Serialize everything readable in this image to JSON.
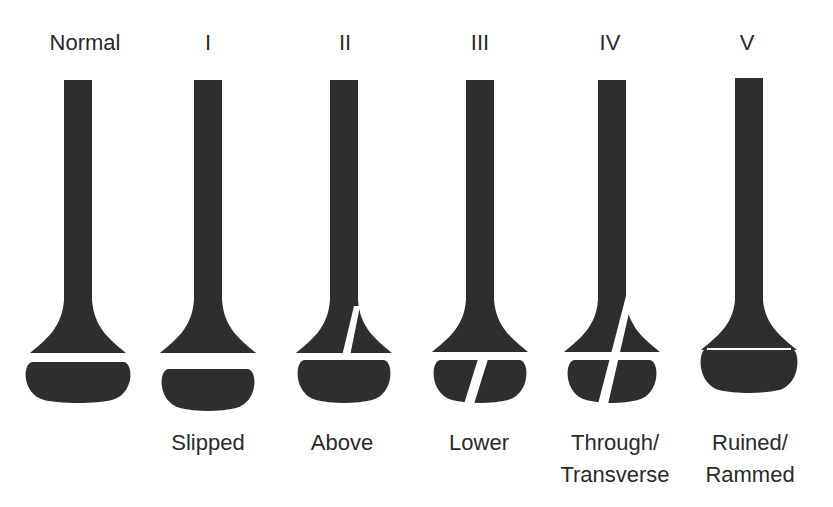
{
  "figure": {
    "bone_color": "#2e2e2e",
    "gap_color": "#ffffff",
    "background": "#ffffff"
  },
  "bones": [
    {
      "id": "normal",
      "type_label": "Normal",
      "description": "",
      "cx": 78,
      "fracture": "none"
    },
    {
      "id": "type-1",
      "type_label": "I",
      "description": "Slipped",
      "cx": 208,
      "fracture": "slipped"
    },
    {
      "id": "type-2",
      "type_label": "II",
      "description": "Above",
      "cx": 344,
      "fracture": "above"
    },
    {
      "id": "type-3",
      "type_label": "III",
      "description": "Lower",
      "cx": 480,
      "fracture": "lower"
    },
    {
      "id": "type-4",
      "type_label": "IV",
      "description": "Through/\nTransverse",
      "description_lines": [
        "Through/",
        "Transverse"
      ],
      "cx": 612,
      "fracture": "through"
    },
    {
      "id": "type-5",
      "type_label": "V",
      "description": "Ruined/\nRammed",
      "description_lines": [
        "Ruined/",
        "Rammed"
      ],
      "cx": 749,
      "fracture": "rammed"
    }
  ]
}
